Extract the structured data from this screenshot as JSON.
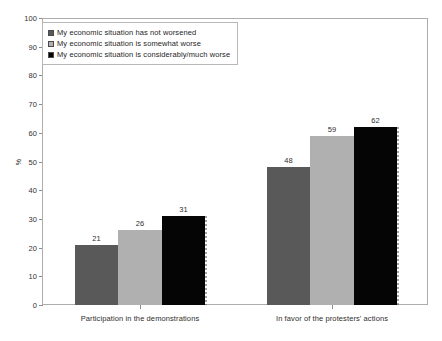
{
  "chart_data": {
    "type": "bar",
    "title": "",
    "xlabel": "",
    "ylabel": "%",
    "ylim": [
      0,
      100
    ],
    "ytick_step": 10,
    "yticks": [
      100,
      90,
      80,
      70,
      60,
      50,
      40,
      30,
      20,
      10,
      0
    ],
    "grid": false,
    "legend_position": "upper-left-inside",
    "categories": [
      "Participation in the demonstrations",
      "In favor of the protesters' actions"
    ],
    "series": [
      {
        "name": "My economic situation has not worsened",
        "color": "#595959",
        "swatch": "dark-gray-swatch",
        "values": [
          21,
          48
        ]
      },
      {
        "name": "My economic situation is somewhat worse",
        "color": "#b0b0b0",
        "swatch": "light-gray-swatch",
        "values": [
          26,
          59
        ]
      },
      {
        "name": "My economic situation is considerably/much worse",
        "color": "#050505",
        "swatch": "black-swatch",
        "values": [
          31,
          62
        ]
      }
    ]
  },
  "legend": {
    "items": [
      {
        "label": "My economic situation has not worsened",
        "color": "#595959"
      },
      {
        "label": "My economic situation is somewhat worse",
        "color": "#b0b0b0"
      },
      {
        "label": "My economic situation is considerably/much worse",
        "color": "#050505"
      }
    ]
  },
  "axis": {
    "y_label": "%",
    "y_min": 0,
    "y_max": 100,
    "y_ticks": [
      "100",
      "90",
      "80",
      "70",
      "60",
      "50",
      "40",
      "30",
      "20",
      "10",
      "0"
    ],
    "x_categories": [
      "Participation in the demonstrations",
      "In favor of the protesters' actions"
    ]
  }
}
